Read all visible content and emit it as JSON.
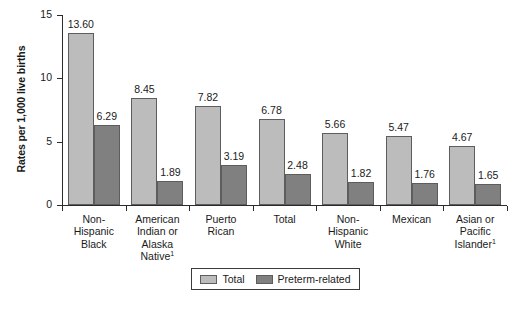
{
  "chart_data": {
    "type": "bar",
    "title": "",
    "xlabel": "",
    "ylabel": "Rates per 1,000 live births",
    "ylim": [
      0,
      15
    ],
    "yticks": [
      0,
      5,
      10,
      15
    ],
    "ytick_labels": [
      "0",
      "5",
      "10",
      "15"
    ],
    "grid": false,
    "legend_position": "bottom-center",
    "categories": [
      "Non-Hispanic Black",
      "American Indian or Alaska Native",
      "Puerto Rican",
      "Total",
      "Non-Hispanic White",
      "Mexican",
      "Asian or Pacific Islander"
    ],
    "category_lines": [
      [
        "Non-",
        "Hispanic",
        "Black"
      ],
      [
        "American",
        "Indian or",
        "Alaska",
        "Native"
      ],
      [
        "Puerto",
        "Rican"
      ],
      [
        "Total"
      ],
      [
        "Non-",
        "Hispanic",
        "White"
      ],
      [
        "Mexican"
      ],
      [
        "Asian or",
        "Pacific",
        "Islander"
      ]
    ],
    "category_footnotes": [
      "",
      "1",
      "",
      "",
      "",
      "",
      "1"
    ],
    "series": [
      {
        "name": "Total",
        "color": "#bcbcbc",
        "values": [
          13.6,
          8.45,
          7.82,
          6.78,
          5.66,
          5.47,
          4.67
        ],
        "labels": [
          "13.60",
          "8.45",
          "7.82",
          "6.78",
          "5.66",
          "5.47",
          "4.67"
        ]
      },
      {
        "name": "Preterm-related",
        "color": "#808080",
        "values": [
          6.29,
          1.89,
          3.19,
          2.48,
          1.82,
          1.76,
          1.65
        ],
        "labels": [
          "6.29",
          "1.89",
          "3.19",
          "2.48",
          "1.82",
          "1.76",
          "1.65"
        ]
      }
    ]
  },
  "axis": {
    "y_title": "Rates per 1,000 live births"
  },
  "legend": {
    "items": [
      {
        "label": "Total",
        "color": "#bcbcbc"
      },
      {
        "label": "Preterm-related",
        "color": "#808080"
      }
    ]
  }
}
